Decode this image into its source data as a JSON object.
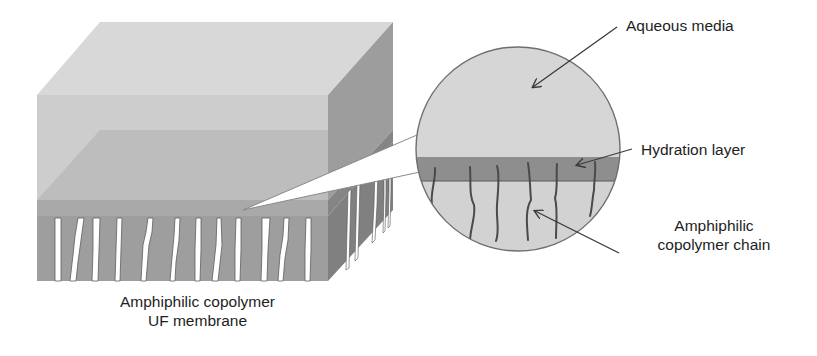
{
  "diagram": {
    "colors": {
      "background": "#ffffff",
      "aqueous_top_face": "#d6d6d6",
      "aqueous_front": "#cccccc",
      "aqueous_side": "#9a9a9a",
      "hydration_front": "#b7b7b7",
      "hydration_band": "#8f8f8f",
      "membrane_body": "#9b9b9b",
      "membrane_side": "#7c7c7c",
      "pore": "#ffffff",
      "circle_fill": "#d4d4d4",
      "circle_hydration": "#8c8c8c",
      "chain": "#4a4a4a",
      "arrow": "#3a3a3a",
      "text": "#1e1e1e"
    },
    "membrane_block": {
      "label_line1": "Amphiphilic copolymer",
      "label_line2": "UF membrane",
      "pore_count_front": 12,
      "pore_count_side": 5
    },
    "magnified_view": {
      "shape": "circle",
      "chain_count": 6
    },
    "annotations": [
      {
        "id": "aqueous-media",
        "text": "Aqueous media"
      },
      {
        "id": "hydration-layer",
        "text": "Hydration layer"
      },
      {
        "id": "copolymer-chain",
        "line1": "Amphiphilic",
        "line2": "copolymer chain"
      }
    ]
  }
}
